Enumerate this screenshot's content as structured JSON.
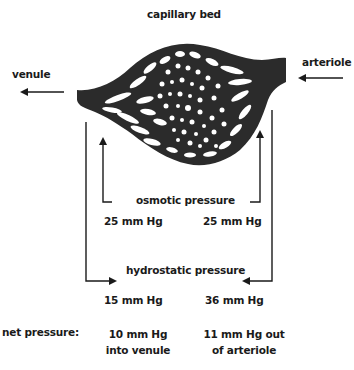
{
  "title": "capillary bed",
  "labels": {
    "venule": "venule",
    "arteriole": "arteriole",
    "osmotic": "osmotic pressure",
    "hydrostatic": "hydrostatic pressure",
    "net": "net pressure:"
  },
  "values": {
    "osmotic_venule": "25 mm Hg",
    "osmotic_arteriole": "25 mm Hg",
    "hydrostatic_venule": "15 mm Hg",
    "hydrostatic_arteriole": "36 mm Hg",
    "net_venule_line1": "10 mm Hg",
    "net_venule_line2": "into venule",
    "net_arteriole_line1": "11 mm Hg out",
    "net_arteriole_line2": "of arteriole"
  },
  "colors": {
    "ink": "#1a1a1a",
    "bed": "#2b2b2b",
    "background": "#ffffff"
  }
}
